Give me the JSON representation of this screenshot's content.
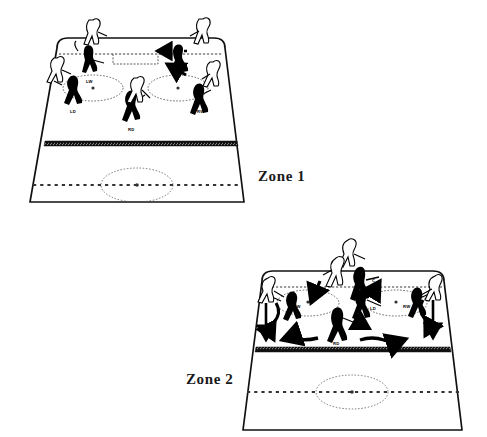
{
  "figure": {
    "background_color": "#ffffff",
    "ink_color": "#000000"
  },
  "zones": [
    {
      "id": "zone-1",
      "caption": "Zone 1",
      "positions": [
        {
          "code": "LW",
          "name": "left-wing"
        },
        {
          "code": "LD",
          "name": "left-defense"
        },
        {
          "code": "RD",
          "name": "right-defense"
        },
        {
          "code": "RW",
          "name": "right-wing"
        }
      ],
      "markings": {
        "goal_line": "dotted",
        "blue_line": "hatched-band",
        "center_line": "dashed",
        "face_off_circles": 2,
        "center_circle": 1,
        "crease": "rectangle"
      },
      "arrows": [
        {
          "name": "puck-path-arrow",
          "direction": "left",
          "style": "dashed"
        },
        {
          "name": "player-move-arrow",
          "direction": "left",
          "style": "solid"
        }
      ]
    },
    {
      "id": "zone-2",
      "caption": "Zone 2",
      "positions": [
        {
          "code": "LW",
          "name": "left-wing"
        },
        {
          "code": "C",
          "name": "center"
        },
        {
          "code": "LD",
          "name": "left-defense"
        },
        {
          "code": "RD",
          "name": "right-defense"
        },
        {
          "code": "RW",
          "name": "right-wing"
        }
      ],
      "markings": {
        "goal_line": "dotted",
        "blue_line": "hatched-band",
        "center_line": "dashed",
        "face_off_circles": 2,
        "center_circle": 1
      },
      "arrows": [
        {
          "name": "left-wing-down-arrow",
          "direction": "down",
          "style": "straight"
        },
        {
          "name": "left-wing-wavy-arrow",
          "direction": "down",
          "style": "wavy"
        },
        {
          "name": "left-sweep-arrow",
          "direction": "left",
          "style": "wavy"
        },
        {
          "name": "right-sweep-arrow",
          "direction": "right",
          "style": "wavy-double"
        },
        {
          "name": "right-wing-down-arrow",
          "direction": "down",
          "style": "straight"
        },
        {
          "name": "right-wing-wavy-arrow",
          "direction": "down",
          "style": "wavy"
        },
        {
          "name": "center-up-arrow",
          "direction": "up",
          "style": "solid"
        },
        {
          "name": "forecheck-left-arrow",
          "direction": "down-left",
          "style": "solid"
        },
        {
          "name": "forecheck-right-arrow",
          "direction": "up-right",
          "style": "solid"
        }
      ]
    }
  ]
}
